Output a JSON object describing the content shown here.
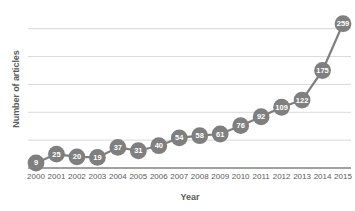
{
  "chart_data": {
    "type": "line",
    "title": "",
    "xlabel": "Year",
    "ylabel": "Number of articles",
    "categories": [
      "2000",
      "2001",
      "2002",
      "2003",
      "2004",
      "2005",
      "2006",
      "2007",
      "2008",
      "2009",
      "2010",
      "2011",
      "2012",
      "2013",
      "2014",
      "2015"
    ],
    "values": [
      9,
      25,
      20,
      19,
      37,
      31,
      40,
      54,
      58,
      61,
      76,
      92,
      109,
      122,
      175,
      259
    ],
    "labels": [
      "9",
      "25",
      "20",
      "19",
      "37",
      "31",
      "40",
      "54",
      "58",
      "61",
      "76",
      "92",
      "109",
      "122",
      "175",
      "259"
    ],
    "ylim": [
      0,
      280
    ],
    "y_gridlines": [
      50,
      100,
      150,
      200,
      250
    ],
    "y_tick_labels_visible": false,
    "grid": true,
    "legend": "none",
    "series": [
      {
        "name": "Number of articles",
        "color": "#7f7f7f",
        "marker": "circle",
        "marker_label_color": "#ffffff",
        "values": [
          9,
          25,
          20,
          19,
          37,
          31,
          40,
          54,
          58,
          61,
          76,
          92,
          109,
          122,
          175,
          259
        ]
      }
    ]
  },
  "style": {
    "line_color": "#7f7f7f",
    "marker_fill": "#7f7f7f",
    "gridline_color": "#d9d9d9",
    "axis_line_color": "#808080",
    "text_color": "#595959",
    "background": "#ffffff"
  }
}
